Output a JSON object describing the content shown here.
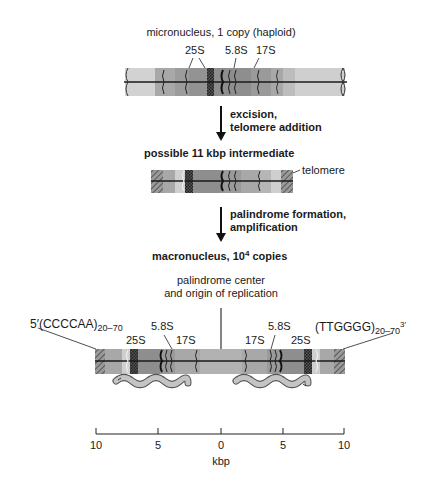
{
  "stages": {
    "micronucleus": {
      "label": "micronucleus, 1 copy (haploid)",
      "gene_labels": [
        "25S",
        "5.8S",
        "17S"
      ]
    },
    "step1": {
      "line1": "excision,",
      "line2": "telomere addition"
    },
    "intermediate": {
      "label": "possible 11 kbp intermediate",
      "telomere_label": "telomere"
    },
    "step2": {
      "line1": "palindrome formation,",
      "line2": "amplification"
    },
    "macronucleus": {
      "label_prefix": "macronucleus, 10",
      "label_exponent": "4",
      "label_suffix": " copies",
      "center_label_line1": "palindrome center",
      "center_label_line2": "and origin of replication",
      "left_end": {
        "prime": "5′",
        "sequence": "(CCCCAA)",
        "repeat": "20–70"
      },
      "right_end": {
        "sequence": "(TTGGGG)",
        "repeat": "20–70",
        "prime": "3′"
      },
      "left_gene_labels": [
        "25S",
        "5.8S",
        "17S"
      ],
      "right_gene_labels": [
        "17S",
        "5.8S",
        "25S"
      ]
    }
  },
  "scale": {
    "ticks": [
      "10",
      "5",
      "0",
      "5",
      "10"
    ],
    "unit": "kbp"
  },
  "colors": {
    "light_gray": "#cfcfcf",
    "mid_gray": "#a9a9a9",
    "dark_gray": "#8e8e8e",
    "band_dark": "#2a2a2a",
    "worm_fill": "#bdbdbd",
    "line": "#1a1a1a"
  }
}
